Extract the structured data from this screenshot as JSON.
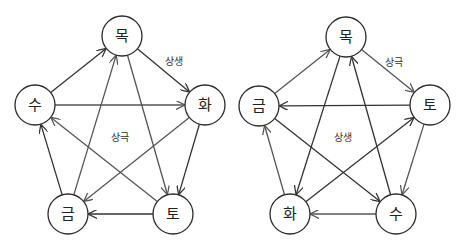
{
  "diagrams": [
    {
      "id": "left",
      "nodes": [
        {
          "key": "mok",
          "label": "목",
          "x": 122,
          "y": 36
        },
        {
          "key": "hwa",
          "label": "화",
          "x": 205,
          "y": 105
        },
        {
          "key": "to",
          "label": "토",
          "x": 173,
          "y": 214
        },
        {
          "key": "geum",
          "label": "금",
          "x": 68,
          "y": 214
        },
        {
          "key": "su",
          "label": "수",
          "x": 35,
          "y": 105
        }
      ],
      "labels": [
        {
          "text": "상생",
          "x": 174,
          "y": 61,
          "name": "label-sangsaeng"
        },
        {
          "text": "상극",
          "x": 120,
          "y": 137,
          "name": "label-sanggeuk"
        }
      ],
      "edges": [
        {
          "from": "mok",
          "to": "hwa",
          "color": "#333333"
        },
        {
          "from": "hwa",
          "to": "to",
          "color": "#333333"
        },
        {
          "from": "to",
          "to": "geum",
          "color": "#333333"
        },
        {
          "from": "geum",
          "to": "su",
          "color": "#333333"
        },
        {
          "from": "su",
          "to": "mok",
          "color": "#333333"
        },
        {
          "from": "su",
          "to": "hwa",
          "color": "#555555"
        },
        {
          "from": "hwa",
          "to": "geum",
          "color": "#555555"
        },
        {
          "from": "geum",
          "to": "mok",
          "color": "#555555"
        },
        {
          "from": "mok",
          "to": "to",
          "color": "#555555"
        },
        {
          "from": "to",
          "to": "su",
          "color": "#555555"
        }
      ]
    },
    {
      "id": "right",
      "nodes": [
        {
          "key": "mok",
          "label": "목",
          "x": 346,
          "y": 37
        },
        {
          "key": "to",
          "label": "토",
          "x": 430,
          "y": 105
        },
        {
          "key": "su",
          "label": "수",
          "x": 396,
          "y": 214
        },
        {
          "key": "hwa",
          "label": "화",
          "x": 290,
          "y": 214
        },
        {
          "key": "geum",
          "label": "금",
          "x": 259,
          "y": 106
        }
      ],
      "labels": [
        {
          "text": "상극",
          "x": 394,
          "y": 62,
          "name": "label-sanggeuk"
        },
        {
          "text": "상생",
          "x": 343,
          "y": 137,
          "name": "label-sangsaeng"
        }
      ],
      "edges": [
        {
          "from": "mok",
          "to": "to",
          "color": "#555555"
        },
        {
          "from": "to",
          "to": "su",
          "color": "#555555"
        },
        {
          "from": "su",
          "to": "hwa",
          "color": "#555555"
        },
        {
          "from": "hwa",
          "to": "geum",
          "color": "#555555"
        },
        {
          "from": "geum",
          "to": "mok",
          "color": "#555555"
        },
        {
          "from": "to",
          "to": "geum",
          "color": "#333333"
        },
        {
          "from": "geum",
          "to": "su",
          "color": "#333333"
        },
        {
          "from": "su",
          "to": "mok",
          "color": "#333333"
        },
        {
          "from": "mok",
          "to": "hwa",
          "color": "#333333"
        },
        {
          "from": "hwa",
          "to": "to",
          "color": "#333333"
        }
      ]
    }
  ],
  "style": {
    "node_radius": 20
  }
}
